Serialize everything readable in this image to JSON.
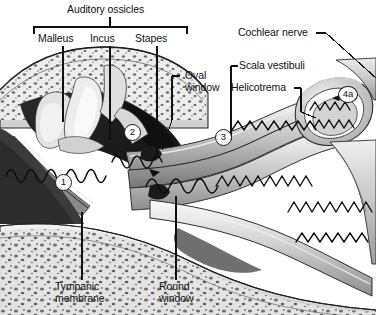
{
  "figure": {
    "type": "anatomical-diagram",
    "background_color": "#ffffff",
    "ink_color": "#111111",
    "palette": [
      "#ffffff",
      "#e8e8e8",
      "#c9c9c9",
      "#9a9a9a",
      "#6b6b6b",
      "#3a3a3a",
      "#141414"
    ]
  },
  "labels": {
    "group_title": "Auditory ossicles",
    "ossicles": [
      {
        "label": "Malleus"
      },
      {
        "label": "Incus"
      },
      {
        "label": "Stapes"
      }
    ],
    "cochlear_nerve": "Cochlear nerve",
    "oval_window_line1": "Oval",
    "oval_window_line2": "window",
    "scala_vestibuli": "Scala vestibuli",
    "helicotrema": "Helicotrema",
    "tympanic_line1": "Tympanic",
    "tympanic_line2": "membrane",
    "round_window_line1": "Round",
    "round_window_line2": "window"
  },
  "markers": [
    {
      "text": "1"
    },
    {
      "text": "2"
    },
    {
      "text": "3"
    },
    {
      "text": "4a"
    }
  ]
}
